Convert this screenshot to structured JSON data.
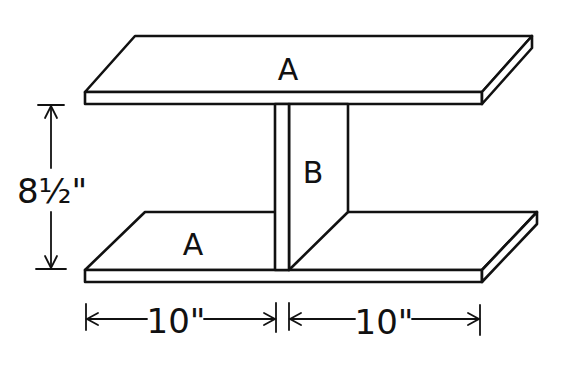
{
  "diagram": {
    "type": "assembly-drawing",
    "parts": [
      {
        "id": "top-board",
        "label": "A"
      },
      {
        "id": "bottom-board",
        "label": "A"
      },
      {
        "id": "center-divider",
        "label": "B"
      }
    ],
    "dimensions": {
      "height": "8½\"",
      "left_width": "10\"",
      "right_width": "10\""
    },
    "colors": {
      "line": "#111111",
      "background": "#ffffff"
    }
  }
}
